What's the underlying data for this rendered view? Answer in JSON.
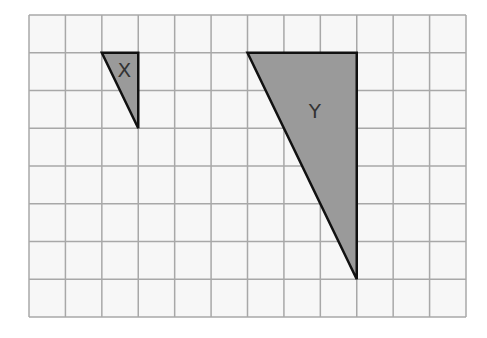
{
  "grid": {
    "left": 29,
    "top": 15,
    "right": 466,
    "bottom": 317,
    "columns": 12,
    "rows": 8,
    "line_color": "#a8a8a8",
    "background": "#f7f7f7"
  },
  "shapes": [
    {
      "name": "triangle-x",
      "label": "X",
      "grid_vertices": [
        [
          2,
          1
        ],
        [
          3,
          1
        ],
        [
          3,
          3
        ]
      ],
      "fill": "#9a9a9a",
      "stroke": "#111111",
      "label_grid_pos": [
        2.62,
        1.45
      ]
    },
    {
      "name": "triangle-y",
      "label": "Y",
      "grid_vertices": [
        [
          6,
          1
        ],
        [
          9,
          1
        ],
        [
          9,
          7
        ]
      ],
      "fill": "#9a9a9a",
      "stroke": "#111111",
      "label_grid_pos": [
        7.85,
        2.55
      ]
    }
  ]
}
